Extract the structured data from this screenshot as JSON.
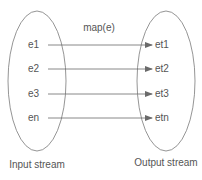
{
  "diagram": {
    "type": "mapping",
    "title": "map(e)",
    "colors": {
      "stroke": "#7a7a7a",
      "arrow": "#6a6a6a",
      "text": "#555555",
      "background": "#ffffff"
    },
    "input_set": {
      "caption": "Input stream",
      "elements": [
        "e1",
        "e2",
        "e3",
        "en"
      ]
    },
    "output_set": {
      "caption": "Output stream",
      "elements": [
        "et1",
        "et2",
        "et3",
        "etn"
      ]
    },
    "mappings": [
      {
        "from": "e1",
        "to": "et1"
      },
      {
        "from": "e2",
        "to": "et2"
      },
      {
        "from": "e3",
        "to": "et3"
      },
      {
        "from": "en",
        "to": "etn"
      }
    ]
  }
}
